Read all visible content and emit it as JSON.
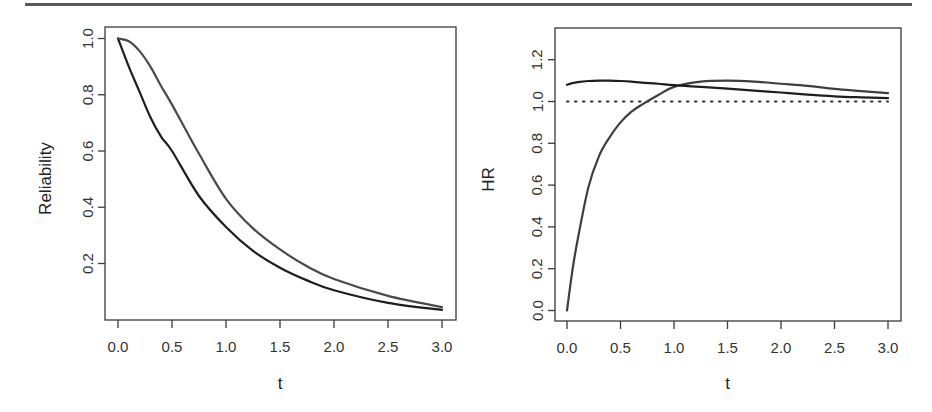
{
  "chart_data": [
    {
      "id": "reliability",
      "type": "line",
      "title": "",
      "xlabel": "t",
      "ylabel": "Reliability",
      "xlim": [
        0,
        3
      ],
      "ylim": [
        0.035,
        1.0
      ],
      "xticks": [
        0.0,
        0.5,
        1.0,
        1.5,
        2.0,
        2.5,
        3.0
      ],
      "xtick_labels": [
        "0.0",
        "0.5",
        "1.0",
        "1.5",
        "2.0",
        "2.5",
        "3.0"
      ],
      "yticks": [
        0.2,
        0.4,
        0.6,
        0.8,
        1.0
      ],
      "ytick_labels": [
        "0.2",
        "0.4",
        "0.6",
        "0.8",
        "1.0"
      ],
      "grid": false,
      "legend": null,
      "x": [
        0.0,
        0.1,
        0.2,
        0.3,
        0.4,
        0.5,
        0.75,
        1.0,
        1.25,
        1.5,
        1.75,
        2.0,
        2.5,
        3.0
      ],
      "series": [
        {
          "name": "curve-1 (lower)",
          "color": "#1e1e1e",
          "values": [
            1.0,
            0.9,
            0.81,
            0.72,
            0.65,
            0.6,
            0.44,
            0.33,
            0.245,
            0.185,
            0.14,
            0.105,
            0.06,
            0.035
          ]
        },
        {
          "name": "curve-2 (upper)",
          "color": "#4a4a4a",
          "values": [
            1.0,
            0.99,
            0.955,
            0.9,
            0.83,
            0.765,
            0.59,
            0.43,
            0.325,
            0.25,
            0.19,
            0.145,
            0.085,
            0.045
          ]
        }
      ]
    },
    {
      "id": "hazard-ratio",
      "type": "line",
      "title": "",
      "xlabel": "t",
      "ylabel": "HR",
      "xlim": [
        0,
        3
      ],
      "ylim": [
        0.0,
        1.3
      ],
      "xticks": [
        0.0,
        0.5,
        1.0,
        1.5,
        2.0,
        2.5,
        3.0
      ],
      "xtick_labels": [
        "0.0",
        "0.5",
        "1.0",
        "1.5",
        "2.0",
        "2.5",
        "3.0"
      ],
      "yticks": [
        0.0,
        0.2,
        0.4,
        0.6,
        0.8,
        1.0,
        1.2
      ],
      "ytick_labels": [
        "0.0",
        "0.2",
        "0.4",
        "0.6",
        "0.8",
        "1.0",
        "1.2"
      ],
      "grid": false,
      "legend": null,
      "reference_line": {
        "y": 1.0,
        "style": "dotted"
      },
      "x": [
        0.0,
        0.05,
        0.1,
        0.2,
        0.3,
        0.4,
        0.5,
        0.6,
        0.7,
        0.85,
        1.0,
        1.25,
        1.5,
        1.75,
        2.0,
        2.25,
        2.5,
        2.75,
        3.0
      ],
      "series": [
        {
          "name": "curve-1 (rising)",
          "color": "#3e3e3e",
          "values": [
            0.0,
            0.19,
            0.34,
            0.59,
            0.74,
            0.83,
            0.9,
            0.95,
            0.985,
            1.03,
            1.07,
            1.095,
            1.1,
            1.095,
            1.085,
            1.075,
            1.06,
            1.05,
            1.04
          ]
        },
        {
          "name": "curve-2 (flat)",
          "color": "#1e1e1e",
          "values": [
            1.08,
            1.088,
            1.093,
            1.098,
            1.1,
            1.1,
            1.098,
            1.095,
            1.09,
            1.085,
            1.078,
            1.07,
            1.062,
            1.052,
            1.043,
            1.033,
            1.025,
            1.02,
            1.016
          ]
        }
      ]
    }
  ],
  "layout": {
    "panels": [
      {
        "box": {
          "left": 105,
          "top": 27,
          "right": 456,
          "bottom": 320
        },
        "xmap": {
          "x0": 118,
          "x1": 442
        },
        "ymap": {
          "v0": 0.2,
          "p0": 263.5,
          "v1": 1.0,
          "p1": 38.5
        },
        "ylabel_x": 45,
        "xlabel_y": 389
      },
      {
        "box": {
          "left": 555,
          "top": 28,
          "right": 901,
          "bottom": 321
        },
        "xmap": {
          "x0": 567,
          "x1": 888
        },
        "ymap": {
          "v0": 0.0,
          "p0": 310.5,
          "v1": 1.0,
          "p1": 101.5
        },
        "ylabel_x": 488,
        "xlabel_y": 389
      }
    ]
  }
}
